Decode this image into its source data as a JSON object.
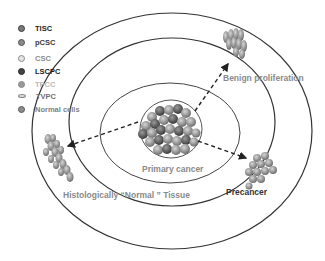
{
  "legend": {
    "items": [
      {
        "label": "TISC",
        "color": "#222222",
        "fill": "#7a7a7a",
        "border": "#3a3a3a"
      },
      {
        "label": "pCSC",
        "color": "#3a3a3a",
        "fill": "#8a8a8a",
        "border": "#555555"
      },
      {
        "label": "CSC",
        "color": "#8a8a8a",
        "fill": "#d8d8d8",
        "border": "#8a8a8a"
      },
      {
        "label": "LSCPC",
        "color": "#1a1a1a",
        "fill": "#444444",
        "border": "#2a2a2a"
      },
      {
        "label": "TPCC",
        "color": "#b0b0b0",
        "fill": "#9a9a9a",
        "border": "#888888"
      },
      {
        "label": "TVPC",
        "color": "#707070",
        "fill": "#dddddd",
        "border": "#888888"
      },
      {
        "label": "Normal cells",
        "color": "#808080",
        "fill": "#8c8c8c",
        "border": "#5a5a5a"
      }
    ]
  },
  "regions": {
    "primary_cancer": "Primary cancer",
    "benign_proliferation": "Benign proliferation",
    "normal_tissue": "Histologically “Normal ” Tissue",
    "precancer": "Precancer"
  },
  "colors": {
    "ring": "#333333",
    "arrow": "#222222",
    "label_gray": "#8a8a8a",
    "label_dark": "#333333"
  }
}
